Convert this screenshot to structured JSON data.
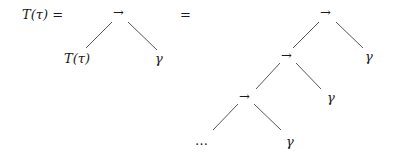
{
  "equation": {
    "lhs": "T(τ) =",
    "equals": "="
  },
  "left_tree": {
    "root": "→",
    "left_child": "T(τ)",
    "right_child": "γ"
  },
  "right_tree": {
    "level0": {
      "node": "→",
      "right_leaf": "γ"
    },
    "level1": {
      "node": "→",
      "right_leaf": "γ"
    },
    "level2": {
      "node": "→",
      "right_leaf": "γ"
    },
    "continuation": "…"
  }
}
